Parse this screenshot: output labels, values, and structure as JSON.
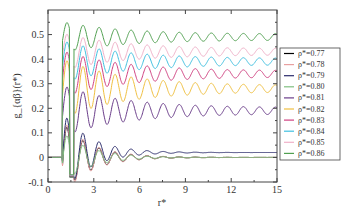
{
  "chart_data": {
    "type": "line",
    "title": "",
    "xlabel": "r*",
    "ylabel": "g_{αβ}(r*)",
    "xlim": [
      0,
      15
    ],
    "ylim": [
      -0.1,
      0.6
    ],
    "xticks": [
      "0",
      "3",
      "6",
      "9",
      "12",
      "15"
    ],
    "yticks": [
      "-0.1",
      "0",
      "0.1",
      "0.2",
      "0.3",
      "0.4",
      "0.5"
    ],
    "grid": false,
    "legend_position": "right-outside",
    "series": [
      {
        "name": "ρ*=0.77",
        "color": "#000000",
        "plateau": 0.0,
        "peak": 0.14
      },
      {
        "name": "ρ*=0.78",
        "color": "#e8a0a0",
        "plateau": 0.0,
        "peak": 0.15
      },
      {
        "name": "ρ*=0.79",
        "color": "#2b2b6b",
        "plateau": 0.02,
        "peak": 0.18
      },
      {
        "name": "ρ*=0.80",
        "color": "#7fbf7f",
        "plateau": 0.0,
        "peak": 0.1
      },
      {
        "name": "ρ*=0.81",
        "color": "#6a3d8a",
        "plateau": 0.19,
        "peak": 0.29
      },
      {
        "name": "ρ*=0.82",
        "color": "#f0c040",
        "plateau": 0.28,
        "peak": 0.4
      },
      {
        "name": "ρ*=0.83",
        "color": "#d04080",
        "plateau": 0.34,
        "peak": 0.43
      },
      {
        "name": "ρ*=0.84",
        "color": "#40c0e0",
        "plateau": 0.39,
        "peak": 0.47
      },
      {
        "name": "ρ*=0.85",
        "color": "#f0b0c8",
        "plateau": 0.43,
        "peak": 0.5
      },
      {
        "name": "ρ*=0.86",
        "color": "#50a050",
        "plateau": 0.49,
        "peak": 0.545
      }
    ]
  }
}
